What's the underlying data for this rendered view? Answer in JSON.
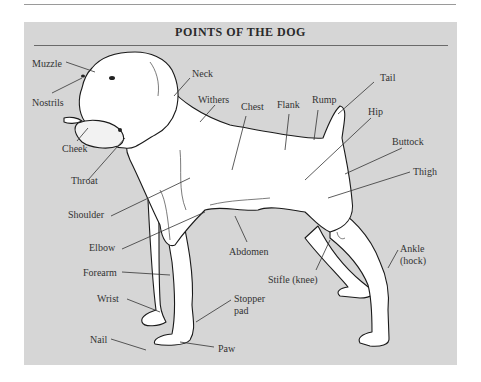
{
  "figure": {
    "title": "POINTS OF THE DOG",
    "background_color": "#d6d6d6",
    "labels": [
      {
        "id": "muzzle",
        "text": "Muzzle",
        "x": 32,
        "y": 58
      },
      {
        "id": "nostrils",
        "text": "Nostrils",
        "x": 32,
        "y": 97
      },
      {
        "id": "cheek",
        "text": "Cheek",
        "x": 62,
        "y": 143
      },
      {
        "id": "throat",
        "text": "Throat",
        "x": 71,
        "y": 175
      },
      {
        "id": "neck",
        "text": "Neck",
        "x": 192,
        "y": 68
      },
      {
        "id": "withers",
        "text": "Withers",
        "x": 198,
        "y": 94
      },
      {
        "id": "chest",
        "text": "Chest",
        "x": 241,
        "y": 101
      },
      {
        "id": "flank",
        "text": "Flank",
        "x": 277,
        "y": 99
      },
      {
        "id": "rump",
        "text": "Rump",
        "x": 312,
        "y": 94
      },
      {
        "id": "tail",
        "text": "Tail",
        "x": 380,
        "y": 72
      },
      {
        "id": "hip",
        "text": "Hip",
        "x": 368,
        "y": 106
      },
      {
        "id": "buttock",
        "text": "Buttock",
        "x": 392,
        "y": 136
      },
      {
        "id": "thigh",
        "text": "Thigh",
        "x": 413,
        "y": 166
      },
      {
        "id": "shoulder",
        "text": "Shoulder",
        "x": 68,
        "y": 209
      },
      {
        "id": "elbow",
        "text": "Elbow",
        "x": 89,
        "y": 242
      },
      {
        "id": "abdomen",
        "text": "Abdomen",
        "x": 229,
        "y": 246
      },
      {
        "id": "stifle",
        "text": "Stifle (knee)",
        "x": 268,
        "y": 274
      },
      {
        "id": "ankle",
        "text": "Ankle",
        "x": 400,
        "y": 243
      },
      {
        "id": "hock",
        "text": "(hock)",
        "x": 400,
        "y": 255
      },
      {
        "id": "forearm",
        "text": "Forearm",
        "x": 83,
        "y": 267
      },
      {
        "id": "wrist",
        "text": "Wrist",
        "x": 97,
        "y": 293
      },
      {
        "id": "stopper-pad",
        "text": "Stopper",
        "x": 234,
        "y": 293
      },
      {
        "id": "stopper-pad-2",
        "text": "pad",
        "x": 234,
        "y": 305
      },
      {
        "id": "nail",
        "text": "Nail",
        "x": 90,
        "y": 334
      },
      {
        "id": "paw",
        "text": "Paw",
        "x": 218,
        "y": 343
      }
    ]
  }
}
